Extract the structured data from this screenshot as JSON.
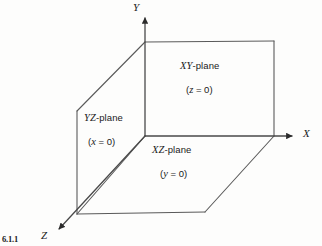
{
  "figure": {
    "caption": "6.1.1",
    "background_color": "#fdfdfc",
    "line_color": "#5a5a5a",
    "text_color": "#1a1a1a"
  },
  "axes": [
    {
      "name": "y-axis",
      "label": "Y",
      "label_x": 133,
      "label_y": 2,
      "from": [
        145,
        136
      ],
      "to": [
        145,
        14
      ]
    },
    {
      "name": "x-axis",
      "label": "X",
      "label_x": 303,
      "label_y": 128,
      "from": [
        145,
        136
      ],
      "to": [
        295,
        136
      ]
    },
    {
      "name": "z-axis",
      "label": "Z",
      "label_x": 41,
      "label_y": 230,
      "from": [
        145,
        136
      ],
      "to": [
        55,
        233
      ]
    }
  ],
  "planes": [
    {
      "id": "xy-plane",
      "name": "XY-plane",
      "italic_part": "XY",
      "plain_part": "-plane",
      "equation_open": "(",
      "equation_var": "z",
      "equation_rest": " = 0)",
      "equation_full": "(z = 0)",
      "label_x": 180,
      "label_y": 61,
      "equation_x": 186,
      "equation_y": 85,
      "polygon": "145,42 274,41 274,136 145,136"
    },
    {
      "id": "yz-plane",
      "name": "YZ-plane",
      "italic_part": "YZ",
      "plain_part": "-plane",
      "equation_open": "(",
      "equation_var": "x",
      "equation_rest": " = 0)",
      "equation_full": "(x = 0)",
      "label_x": 84,
      "label_y": 113,
      "equation_x": 88,
      "equation_y": 137,
      "polygon": "77,111 145,42 145,136 77,214"
    },
    {
      "id": "xz-plane",
      "name": "XZ-plane",
      "italic_part": "XZ",
      "plain_part": "-plane",
      "equation_open": "(",
      "equation_var": "y",
      "equation_rest": " = 0)",
      "equation_full": "(y = 0)",
      "label_x": 152,
      "label_y": 145,
      "equation_x": 160,
      "equation_y": 169,
      "polygon": "77,214 145,136 274,136 205,212"
    }
  ],
  "edges": [
    {
      "name": "xy-top-edge",
      "from": [
        145,
        42
      ],
      "to": [
        274,
        41
      ]
    },
    {
      "name": "xy-right-edge",
      "from": [
        274,
        41
      ],
      "to": [
        274,
        136
      ]
    },
    {
      "name": "yz-top-diagonal",
      "from": [
        77,
        111
      ],
      "to": [
        145,
        42
      ]
    },
    {
      "name": "yz-left-edge",
      "from": [
        77,
        111
      ],
      "to": [
        77,
        214
      ]
    },
    {
      "name": "yz-bottom-diagonal",
      "from": [
        77,
        214
      ],
      "to": [
        145,
        136
      ]
    },
    {
      "name": "xz-bottom-edge",
      "from": [
        77,
        214
      ],
      "to": [
        205,
        212
      ]
    },
    {
      "name": "xz-right-diagonal",
      "from": [
        205,
        212
      ],
      "to": [
        274,
        136
      ]
    }
  ]
}
